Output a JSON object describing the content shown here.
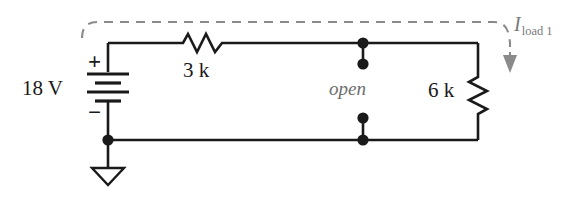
{
  "figure": {
    "background_color": "#ffffff",
    "wire_color": "#1a1a1a",
    "dashed_color": "#8a8a8a",
    "label_color": "#1a1a1a",
    "gray_label_color": "#6e6e6e"
  },
  "labels": {
    "source_value": "18 V",
    "polarity_plus": "+",
    "polarity_minus": "−",
    "resistor_series": "3 k",
    "resistor_load": "6 k",
    "open_terminals": "open",
    "current_symbol": "I",
    "current_subscript": "load 1"
  },
  "components": [
    {
      "name": "voltage-source",
      "type": "battery",
      "label": "18 V",
      "terminals": {
        "positive": "+",
        "negative": "−"
      }
    },
    {
      "name": "series-resistor",
      "type": "resistor",
      "orientation": "horizontal",
      "label": "3 k"
    },
    {
      "name": "load-resistor",
      "type": "resistor",
      "orientation": "vertical",
      "label": "6 k"
    },
    {
      "name": "open-terminal-pair",
      "type": "open-circuit",
      "label": "open"
    },
    {
      "name": "ground",
      "type": "earth-ground",
      "label": ""
    },
    {
      "name": "current-annotation",
      "type": "current-arrow",
      "label": "I load 1"
    }
  ]
}
